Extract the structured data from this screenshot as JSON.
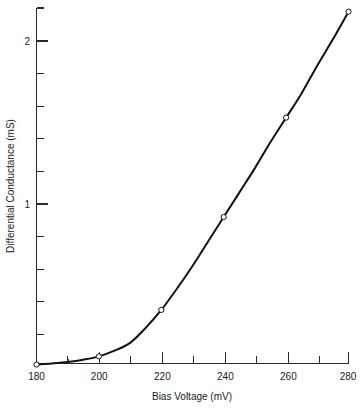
{
  "chart_data": {
    "type": "line",
    "title": "",
    "xlabel": "Bias Voltage (mV)",
    "ylabel": "Differential Conductance (mS)",
    "xlim": [
      180,
      280
    ],
    "ylim": [
      0,
      2.18
    ],
    "grid": false,
    "legend": null,
    "x_major_ticks": [
      180,
      200,
      220,
      240,
      260,
      280
    ],
    "x_major_tick_labels": [
      "180",
      "200",
      "220",
      "240",
      "260",
      "280"
    ],
    "x_minor_ticks": [
      190,
      210,
      230,
      250,
      270
    ],
    "y_major_ticks": [
      1,
      2
    ],
    "y_major_tick_labels": [
      "1",
      "2"
    ],
    "y_minor_ticks": [
      0.2,
      0.4,
      0.6,
      0.8,
      1.2,
      1.4,
      1.6,
      1.8,
      2.0
    ],
    "series": [
      {
        "name": "Differential Conductance",
        "marker": "open-circle",
        "color": "#111111",
        "x": [
          180,
          200,
          220,
          240,
          260,
          280
        ],
        "y": [
          0.015,
          0.065,
          0.35,
          0.92,
          1.53,
          2.18
        ]
      }
    ],
    "curve_samples": {
      "x": [
        180,
        185,
        190,
        195,
        200,
        205,
        210,
        215,
        220,
        225,
        230,
        235,
        240,
        245,
        250,
        255,
        260,
        265,
        270,
        275,
        280
      ],
      "y": [
        0.015,
        0.022,
        0.031,
        0.045,
        0.065,
        0.1,
        0.148,
        0.24,
        0.35,
        0.48,
        0.62,
        0.77,
        0.92,
        1.07,
        1.22,
        1.38,
        1.53,
        1.68,
        1.85,
        2.01,
        2.18
      ]
    },
    "drop_lines": [
      {
        "x": 190,
        "y_top": 0.031
      },
      {
        "x": 200,
        "y_top": 0.065
      }
    ],
    "annotations": []
  },
  "axis_labels": {
    "x_title": "Bias Voltage (mV)",
    "y_title": "Differential Conductance (mS)"
  },
  "x_tick_text": {
    "t0": "180",
    "t1": "200",
    "t2": "220",
    "t3": "240",
    "t4": "260",
    "t5": "280"
  },
  "y_tick_text": {
    "t0": "1",
    "t1": "2"
  },
  "colors": {
    "curve": "#111111",
    "axis": "#2a2a2a",
    "background": "#ffffff",
    "marker_fill": "#ffffff"
  }
}
